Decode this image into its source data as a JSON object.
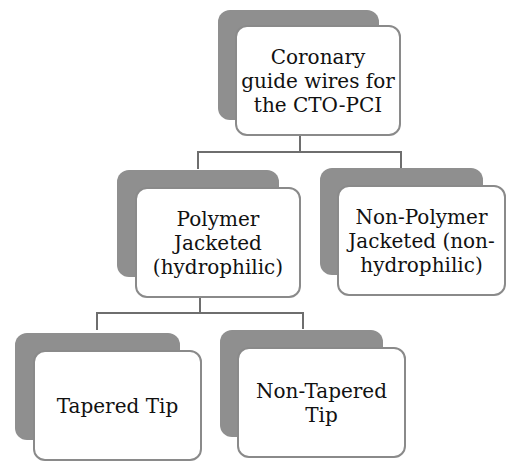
{
  "diagram": {
    "type": "hierarchy",
    "root": {
      "label": "Coronary\nguide wires for\nthe CTO-PCI"
    },
    "level2": [
      {
        "label": "Polymer\nJacketed\n(hydrophilic)"
      },
      {
        "label": "Non-Polymer\nJacketed (non-\nhydrophilic)"
      }
    ],
    "level3": [
      {
        "label": "Tapered Tip"
      },
      {
        "label": "Non-Tapered\nTip"
      }
    ],
    "colors": {
      "shadow": "#8f8f8f",
      "border": "#8a8a8a",
      "connector": "#6e6e6e"
    }
  }
}
